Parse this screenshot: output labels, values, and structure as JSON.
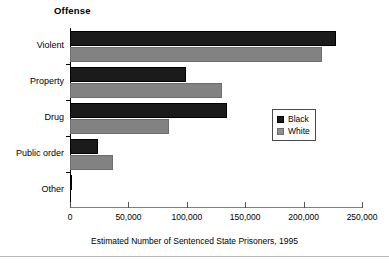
{
  "chart_data": {
    "type": "bar",
    "orientation": "horizontal",
    "title": "Offense",
    "xlabel": "Estimated Number of Sentenced  State Prisoners, 1995",
    "ylabel": "Offense",
    "categories": [
      "Violent",
      "Property",
      "Drug",
      "Public order",
      "Other"
    ],
    "series": [
      {
        "name": "Black",
        "color": "#1b1b1b",
        "values": [
          228000,
          99000,
          134000,
          24000,
          2000
        ]
      },
      {
        "name": "White",
        "color": "#828282",
        "values": [
          216000,
          130000,
          85000,
          37000,
          500
        ]
      }
    ],
    "xlim": [
      0,
      250000
    ],
    "xticks": [
      0,
      50000,
      100000,
      150000,
      200000,
      250000
    ],
    "xticklabels": [
      "0",
      "50,000",
      "100,000",
      "150,000",
      "200,000",
      "250,000"
    ],
    "grid": false,
    "legend": {
      "position": "center-right",
      "entries": [
        "Black",
        "White"
      ]
    }
  }
}
